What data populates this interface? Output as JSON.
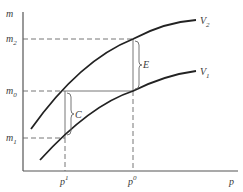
{
  "diagram": {
    "axes": {
      "y_label": "m",
      "x_label": "p"
    },
    "y_ticks": [
      {
        "label": "m",
        "sub": "2",
        "y": 39
      },
      {
        "label": "m",
        "sub": "0",
        "y": 91
      },
      {
        "label": "m",
        "sub": "1",
        "y": 138
      }
    ],
    "x_ticks": [
      {
        "label": "p",
        "sup": "1",
        "x": 65
      },
      {
        "label": "p",
        "sup": "0",
        "x": 133
      }
    ],
    "curves": [
      {
        "label": "V",
        "sub": "2"
      },
      {
        "label": "V",
        "sub": "1"
      }
    ],
    "braces": [
      {
        "label": "C"
      },
      {
        "label": "E"
      }
    ]
  }
}
